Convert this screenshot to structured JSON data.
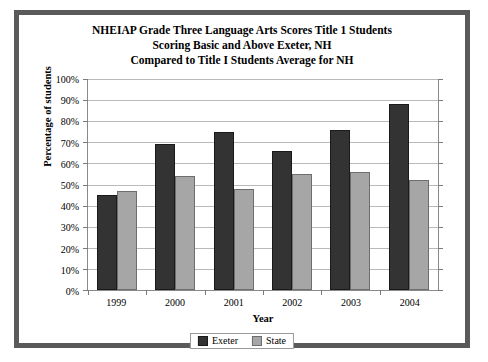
{
  "chart_data": {
    "type": "bar",
    "title": "NHEIAP Grade Three Language Arts Scores Title 1 Students Scoring Basic and Above Exeter, NH Compared to Title I Students Average for NH",
    "title_lines": [
      "NHEIAP Grade Three Language Arts Scores Title 1 Students",
      "Scoring Basic and Above Exeter, NH",
      "Compared to Title I Students Average for NH"
    ],
    "xlabel": "Year",
    "ylabel": "Percentage of students",
    "categories": [
      "1999",
      "2000",
      "2001",
      "2002",
      "2003",
      "2004"
    ],
    "series": [
      {
        "name": "Exeter",
        "color": "#333333",
        "values": [
          45,
          69,
          75,
          66,
          76,
          88
        ]
      },
      {
        "name": "State",
        "color": "#a6a6a6",
        "values": [
          47,
          54,
          48,
          55,
          56,
          52
        ]
      }
    ],
    "ylim": [
      0,
      100
    ],
    "ytick_step": 10,
    "ytick_labels": [
      "100%",
      "90%",
      "80%",
      "70%",
      "60%",
      "50%",
      "40%",
      "30%",
      "20%",
      "10%",
      "0%"
    ],
    "ytick_values": [
      100,
      90,
      80,
      70,
      60,
      50,
      40,
      30,
      20,
      10,
      0
    ],
    "grid": true,
    "legend_position": "bottom",
    "legend": [
      "Exeter",
      "State"
    ],
    "value_unit": "%"
  }
}
